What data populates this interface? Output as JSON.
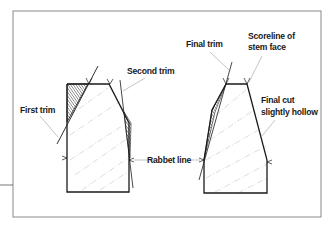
{
  "figure": {
    "type": "technical-illustration",
    "colors": {
      "outline": "#1a1a1a",
      "frame": "#8a8a8a",
      "grain": "#bdbdbd",
      "leader": "#9a9a9a",
      "background": "#ffffff"
    }
  },
  "left_panel": {
    "labels": {
      "first_trim": "First trim",
      "second_trim": "Second trim"
    }
  },
  "center": {
    "labels": {
      "rabbet_line": "Rabbet line"
    }
  },
  "right_panel": {
    "labels": {
      "final_trim": "Final trim",
      "scoreline_line1": "Scoreline of",
      "scoreline_line2": "stem face",
      "final_cut_line1": "Final cut",
      "final_cut_line2": "slightly hollow"
    }
  }
}
